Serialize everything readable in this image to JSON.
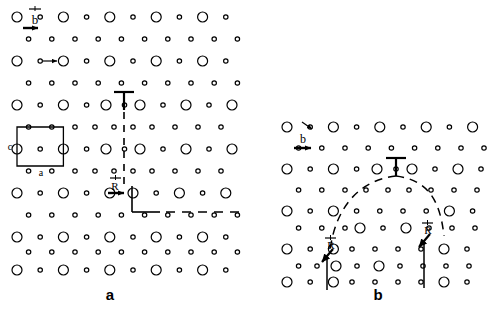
{
  "figure": {
    "type": "crystal-lattice-dislocation-diagram",
    "width": 488,
    "height": 315,
    "background_color": "#ffffff",
    "line_color": "#000000"
  },
  "panels": [
    {
      "id": "a",
      "label": "a",
      "label_position": {
        "x": 100,
        "y": 286
      },
      "region": {
        "x": 0,
        "y": 0,
        "width": 244,
        "height": 280
      },
      "description": "Perfect dislocation in crystal lattice with unit cell outlined",
      "annotations": {
        "burgers_vector": {
          "symbol": "b",
          "overbar": true,
          "x": 33,
          "y": 10
        },
        "unit_cell": {
          "label_c": "c",
          "label_a": "a",
          "x": 17,
          "y": 127,
          "width": 52,
          "height": 40
        },
        "displacement_vector": {
          "symbol": "R",
          "overbar": true,
          "x": 113,
          "y": 186
        },
        "dislocation_symbols": 2
      }
    },
    {
      "id": "b",
      "label": "b",
      "label_position": {
        "x": 368,
        "y": 286
      },
      "region": {
        "x": 250,
        "y": 110,
        "width": 238,
        "height": 170
      },
      "description": "Dissociated dislocation with two R partial dislocations bounding a dashed stacking-fault loop",
      "annotations": {
        "burgers_vector": {
          "symbol": "b",
          "overbar": true,
          "x": 298,
          "y": 133
        },
        "partial_left": {
          "symbol": "R",
          "overbar": true,
          "x": 327,
          "y": 243
        },
        "partial_right": {
          "symbol": "R",
          "overbar": true,
          "x": 424,
          "y": 228
        },
        "dislocation_symbols": 1,
        "fault_arc": "dashed"
      }
    }
  ],
  "lattice": {
    "large_atom_radius": 5.0,
    "small_atom_radius": 2.2,
    "stroke_width": 1.2,
    "panel_a": {
      "col_spacing": 23.2,
      "row_spacing": 22.2,
      "origin_x": 17,
      "origin_y": 17,
      "cols": 11,
      "rows": 7
    },
    "panel_b": {
      "col_spacing": 23.2,
      "row_spacing": 22.2,
      "origin_x": 287,
      "origin_y": 127,
      "cols": 9,
      "rows": 5
    }
  },
  "symbols": {
    "dislocation_glyph": "inverted-tee",
    "vector_overbar": true,
    "arrow_style": "solid-filled-head"
  }
}
